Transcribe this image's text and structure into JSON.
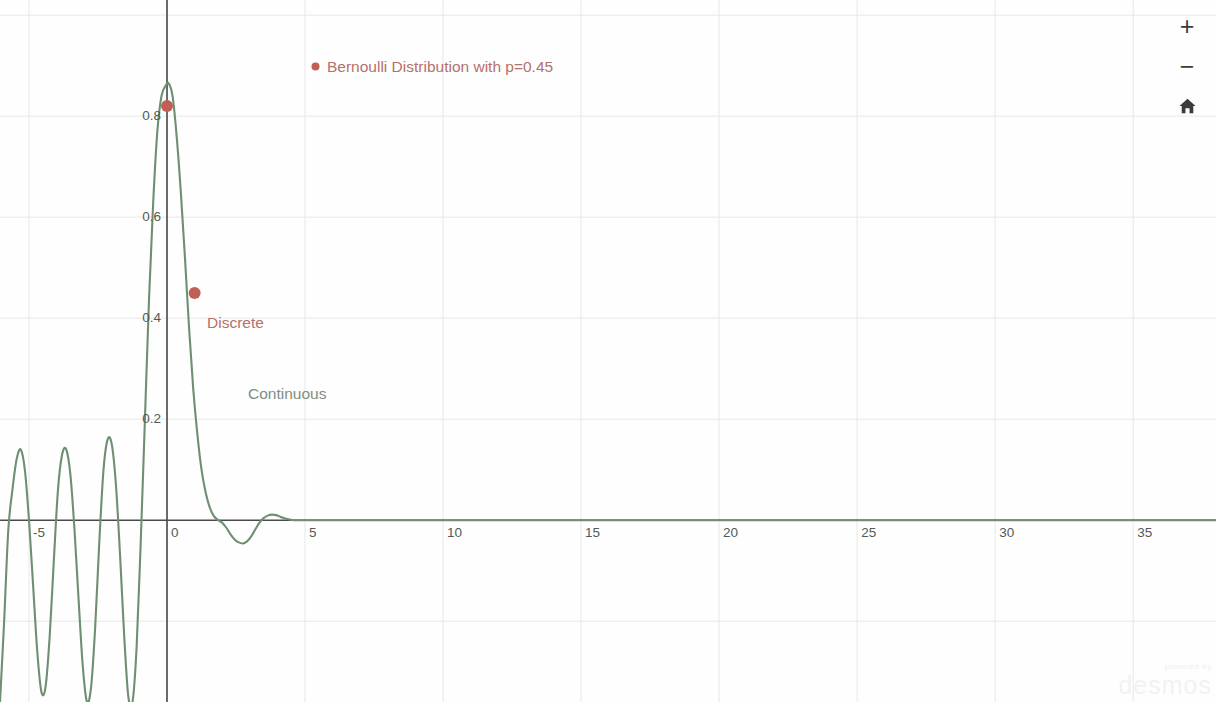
{
  "app": {
    "name": "Desmos Graphing Calculator",
    "watermark_powered": "powered by",
    "watermark_brand": "desmos"
  },
  "controls": {
    "zoom_in_label": "+",
    "zoom_in_icon": "plus-icon",
    "zoom_out_label": "−",
    "zoom_out_icon": "minus-icon",
    "home_label": "⌂",
    "home_icon": "home-icon"
  },
  "annotations": {
    "legend": "Bernoulli Distribution with p=0.45",
    "discrete": "Discrete",
    "continuous": "Continuous"
  },
  "colors": {
    "discrete_red": "#b5716b",
    "discrete_point": "#c05f55",
    "continuous_green": "#6f8f72",
    "grid": "#e8e8ea",
    "axis": "#4a4a4a",
    "tick_text": "#555a55",
    "background": "#fefefe"
  },
  "chart_data": {
    "type": "line",
    "title": "",
    "xlabel": "",
    "ylabel": "",
    "xlim": [
      -6.05,
      38.0
    ],
    "ylim": [
      -0.36,
      1.03
    ],
    "grid": true,
    "grid_step_x": 5,
    "grid_step_y": 0.2,
    "legend_position": "top-left-inside",
    "x_ticks": [
      -5,
      0,
      5,
      10,
      15,
      20,
      25,
      30,
      35
    ],
    "x_tick_labels": [
      "-5",
      "0",
      "5",
      "10",
      "15",
      "20",
      "25",
      "30",
      "35"
    ],
    "y_ticks": [
      0.2,
      0.4,
      0.6,
      0.8
    ],
    "y_tick_labels": [
      "0.2",
      "0.4",
      "0.6",
      "0.8"
    ],
    "series": [
      {
        "name": "Continuous",
        "type": "line",
        "color": "#6f8f72",
        "description": "Oscillating decaying curve peaking near x=0.06 at y=0.865, with damped sinc-like lobes for x<0 and a small negative lobe near x=2.7",
        "x": [
          -6.05,
          -5.9,
          -5.75,
          -5.6,
          -5.45,
          -5.3,
          -5.15,
          -5.0,
          -4.85,
          -4.7,
          -4.55,
          -4.4,
          -4.25,
          -4.1,
          -3.95,
          -3.8,
          -3.65,
          -3.5,
          -3.35,
          -3.2,
          -3.05,
          -2.9,
          -2.75,
          -2.6,
          -2.45,
          -2.3,
          -2.15,
          -2.0,
          -1.85,
          -1.7,
          -1.55,
          -1.4,
          -1.25,
          -1.1,
          -0.95,
          -0.8,
          -0.65,
          -0.5,
          -0.35,
          -0.2,
          -0.05,
          0.06,
          0.2,
          0.35,
          0.5,
          0.65,
          0.8,
          0.95,
          1.1,
          1.25,
          1.4,
          1.55,
          1.7,
          1.85,
          2.0,
          2.15,
          2.3,
          2.45,
          2.6,
          2.75,
          2.9,
          3.05,
          3.2,
          3.35,
          3.5,
          3.65,
          3.8,
          3.95,
          4.1,
          4.25,
          4.4,
          4.6,
          5.0,
          6.0,
          8.0,
          12.0,
          18.0,
          26.0,
          38.0
        ],
        "y": [
          -0.36,
          -0.2,
          -0.02,
          0.06,
          0.12,
          0.14,
          0.1,
          0.0,
          -0.13,
          -0.26,
          -0.34,
          -0.33,
          -0.23,
          -0.08,
          0.06,
          0.13,
          0.14,
          0.09,
          -0.02,
          -0.16,
          -0.29,
          -0.36,
          -0.33,
          -0.21,
          -0.04,
          0.1,
          0.16,
          0.15,
          0.07,
          -0.07,
          -0.23,
          -0.35,
          -0.36,
          -0.25,
          -0.04,
          0.2,
          0.44,
          0.63,
          0.77,
          0.84,
          0.86,
          0.865,
          0.84,
          0.76,
          0.65,
          0.52,
          0.38,
          0.26,
          0.17,
          0.1,
          0.055,
          0.025,
          0.008,
          0.0,
          -0.005,
          -0.015,
          -0.028,
          -0.038,
          -0.044,
          -0.046,
          -0.042,
          -0.032,
          -0.018,
          -0.005,
          0.004,
          0.009,
          0.011,
          0.01,
          0.007,
          0.004,
          0.002,
          0.0,
          0.0,
          0.0,
          0.0,
          0.0,
          0.0,
          0.0,
          0.0
        ]
      },
      {
        "name": "Bernoulli Distribution with p=0.45",
        "type": "scatter",
        "color": "#c05f55",
        "points": [
          {
            "x": 0,
            "y": 0.82
          },
          {
            "x": 1,
            "y": 0.45
          }
        ]
      }
    ]
  }
}
